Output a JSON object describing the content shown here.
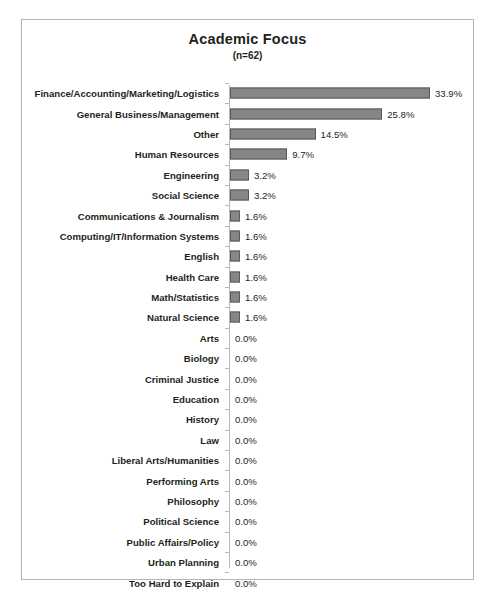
{
  "chart_data": {
    "type": "bar",
    "orientation": "horizontal",
    "title": "Academic Focus",
    "subtitle": "(n=62)",
    "sample_size": 62,
    "xlabel": "",
    "ylabel": "",
    "xlim": [
      0,
      35
    ],
    "grid": false,
    "legend": "none",
    "value_suffix": "%",
    "categories": [
      "Finance/Accounting/Marketing/Logistics",
      "General Business/Management",
      "Other",
      "Human Resources",
      "Engineering",
      "Social Science",
      "Communications & Journalism",
      "Computing/IT/Information Systems",
      "English",
      "Health Care",
      "Math/Statistics",
      "Natural Science",
      "Arts",
      "Biology",
      "Criminal Justice",
      "Education",
      "History",
      "Law",
      "Liberal Arts/Humanities",
      "Performing Arts",
      "Philosophy",
      "Political Science",
      "Public Affairs/Policy",
      "Urban Planning",
      "Too Hard to Explain"
    ],
    "values": [
      33.9,
      25.8,
      14.5,
      9.7,
      3.2,
      3.2,
      1.6,
      1.6,
      1.6,
      1.6,
      1.6,
      1.6,
      0.0,
      0.0,
      0.0,
      0.0,
      0.0,
      0.0,
      0.0,
      0.0,
      0.0,
      0.0,
      0.0,
      0.0,
      0.0
    ],
    "value_labels": [
      "33.9%",
      "25.8%",
      "14.5%",
      "9.7%",
      "3.2%",
      "3.2%",
      "1.6%",
      "1.6%",
      "1.6%",
      "1.6%",
      "1.6%",
      "1.6%",
      "0.0%",
      "0.0%",
      "0.0%",
      "0.0%",
      "0.0%",
      "0.0%",
      "0.0%",
      "0.0%",
      "0.0%",
      "0.0%",
      "0.0%",
      "0.0%",
      "0.0%"
    ],
    "colors": {
      "bar_fill": "#868686",
      "bar_border": "#59595b",
      "axis_line": "#b9b9b9",
      "frame_border": "#b3b3b3",
      "text": "#231f20",
      "background": "#ffffff"
    }
  }
}
